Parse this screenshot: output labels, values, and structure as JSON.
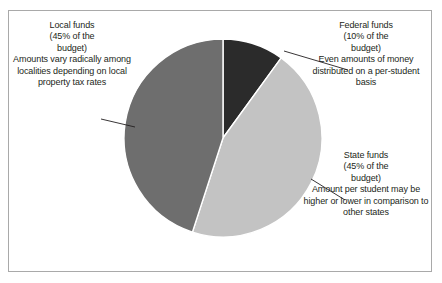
{
  "figure": {
    "background_color": "#ffffff",
    "border_color": "#a9a9a9"
  },
  "chart_data": {
    "type": "pie",
    "title": "",
    "subtitle": "",
    "xlabel": "",
    "ylabel": "",
    "legend_position": "none",
    "grid": false,
    "start_angle_deg": 0,
    "direction": "clockwise",
    "categories": [
      "Federal funds",
      "State funds",
      "Local funds"
    ],
    "values": [
      10,
      45,
      45
    ],
    "value_unit": "percent of the budget",
    "total": 100,
    "colors": [
      "#2b2b2b",
      "#c3c3c3",
      "#6e6e6e"
    ],
    "slices": [
      {
        "name": "Federal funds",
        "value": 10,
        "percent_label": "(10% of the budget)",
        "color": "#2b2b2b",
        "start_deg": 0,
        "end_deg": 36
      },
      {
        "name": "State funds",
        "value": 45,
        "percent_label": "(45% of the budget)",
        "color": "#c3c3c3",
        "start_deg": 36,
        "end_deg": 198
      },
      {
        "name": "Local funds",
        "value": 45,
        "percent_label": "(45% of the budget)",
        "color": "#6e6e6e",
        "start_deg": 198,
        "end_deg": 360
      }
    ],
    "annotations": [
      {
        "target": "Local funds",
        "heading": "Local funds (45% of the budget)",
        "text": "Amounts vary radically among localities depending on local property tax rates"
      },
      {
        "target": "Federal funds",
        "heading": "Federal funds (10% of the budget)",
        "text": "Even amounts of money distributed on a per-student basis"
      },
      {
        "target": "State funds",
        "heading": "State funds (45% of the budget)",
        "text": "Amount per student may be higher or lower in comparison to other states"
      }
    ]
  },
  "callouts": {
    "local": {
      "line1": "Local funds",
      "line2": "(45% of the",
      "line3": "budget)",
      "body": "Amounts vary radically among localities depending on local property tax rates"
    },
    "federal": {
      "line1": "Federal funds",
      "line2": "(10% of the",
      "line3": "budget)",
      "body": "Even amounts of money distributed on a per-student basis"
    },
    "state": {
      "line1": "State funds",
      "line2": "(45% of the",
      "line3": "budget)",
      "body": "Amount per student may be higher or lower in comparison to other states"
    }
  }
}
